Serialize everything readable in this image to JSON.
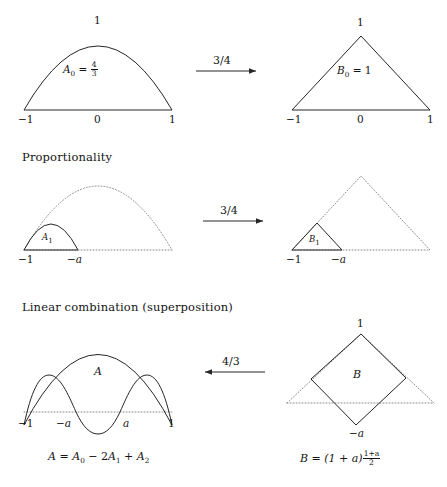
{
  "figure": {
    "title_row1": "",
    "sections": [
      {
        "name": "row1",
        "heading": ""
      },
      {
        "name": "row2",
        "heading": "Proportionality"
      },
      {
        "name": "row3",
        "heading": "Linear combination (superposition)"
      }
    ],
    "rows": [
      {
        "id": "row1",
        "left_shape": "parabola",
        "right_shape": "triangle",
        "arrow": {
          "label": "3/4",
          "direction": "right"
        },
        "left": {
          "area_symbol": "A",
          "area_sub": "0",
          "equals": "=",
          "value_num": "4",
          "value_den": "3",
          "peak_label": "1",
          "axis_ticks": [
            "−1",
            "0",
            "1"
          ]
        },
        "right": {
          "area_symbol": "B",
          "area_sub": "0",
          "equals": "=",
          "value": "1",
          "peak_label": "1",
          "axis_ticks": [
            "−1",
            "0",
            "1"
          ]
        }
      },
      {
        "id": "row2",
        "left_shape": "parabola-scaled",
        "right_shape": "triangle-scaled",
        "arrow": {
          "label": "3/4",
          "direction": "right"
        },
        "left": {
          "area_symbol": "A",
          "area_sub": "1",
          "axis_ticks": [
            "−1",
            "−a"
          ]
        },
        "right": {
          "area_symbol": "B",
          "area_sub": "1",
          "axis_ticks": [
            "−1",
            "−a"
          ]
        }
      },
      {
        "id": "row3",
        "left_shape": "combined-curves",
        "right_shape": "diamond",
        "arrow": {
          "label": "4/3",
          "direction": "left"
        },
        "left": {
          "area_symbol": "A",
          "axis_ticks": [
            "−1",
            "−a",
            "a",
            "1"
          ],
          "equation": {
            "lhs": "A",
            "eq": "=",
            "term1": "A",
            "term1_sub": "0",
            "op1": "−",
            "coef2": "2",
            "term2": "A",
            "term2_sub": "1",
            "op2": "+",
            "term3": "A",
            "term3_sub": "2"
          }
        },
        "right": {
          "area_symbol": "B",
          "top_label": "1",
          "bottom_label": "−a",
          "equation": {
            "lhs": "B",
            "eq": "=",
            "paren": "(1 + a)",
            "frac_num": "1+a",
            "frac_den": "2"
          }
        }
      }
    ],
    "colors": {
      "stroke": "#262626",
      "dotted": "#8a8a8a",
      "text": "#141414",
      "background": "#ffffff"
    }
  }
}
